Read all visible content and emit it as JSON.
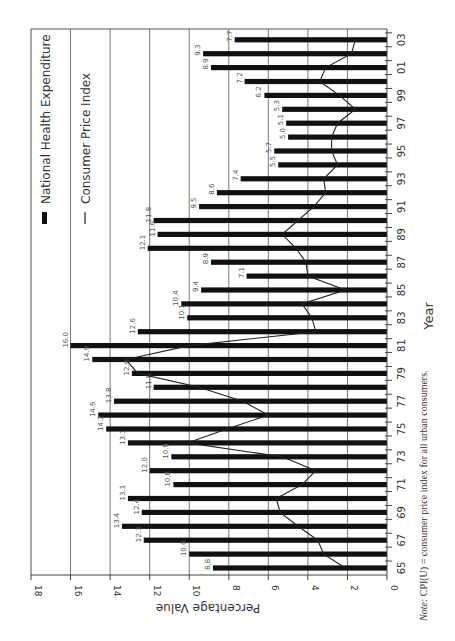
{
  "chart_data": {
    "type": "bar",
    "orientation": "rotated 90 degrees clockwise (years run vertically, values horizontally)",
    "title": "",
    "xlabel": "Year",
    "ylabel": "Percentage Value",
    "ylim": [
      0,
      18
    ],
    "yticks": [
      0,
      2,
      4,
      6,
      8,
      10,
      12,
      14,
      16,
      18
    ],
    "xtick_labels": [
      "65",
      "67",
      "69",
      "71",
      "73",
      "75",
      "77",
      "79",
      "81",
      "83",
      "85",
      "87",
      "89",
      "91",
      "93",
      "95",
      "97",
      "99",
      "01",
      "03"
    ],
    "grid": true,
    "legend_position": "upper left (rotated)",
    "legend": [
      "National Health Expenditure",
      "Consumer Price Index"
    ],
    "categories": [
      "65",
      "66",
      "67",
      "68",
      "69",
      "70",
      "71",
      "72",
      "73",
      "74",
      "75",
      "76",
      "77",
      "78",
      "79",
      "80",
      "81",
      "82",
      "83",
      "84",
      "85",
      "86",
      "87",
      "88",
      "89",
      "90",
      "91",
      "92",
      "93",
      "94",
      "95",
      "96",
      "97",
      "98",
      "99",
      "00",
      "01",
      "02",
      "03"
    ],
    "series": [
      {
        "name": "National Health Expenditure",
        "type": "bar",
        "values": [
          8.8,
          10.0,
          12.3,
          13.4,
          12.4,
          13.1,
          10.8,
          12.0,
          10.9,
          13.1,
          14.2,
          14.6,
          13.8,
          11.8,
          12.9,
          14.9,
          16.0,
          12.6,
          10.1,
          10.4,
          9.4,
          7.1,
          8.9,
          12.1,
          11.6,
          11.8,
          9.5,
          8.6,
          7.4,
          5.5,
          5.7,
          5.0,
          5.1,
          5.3,
          6.2,
          7.2,
          8.9,
          9.3,
          7.7
        ],
        "labels": [
          "8.8",
          "10.0",
          "12.3",
          "13.4",
          "12.4",
          "13.1",
          "10.8",
          "12.0",
          "10.9",
          "13.1",
          "14.2",
          "14.6",
          "13.8",
          "11.8",
          "12.9",
          "14.9",
          "16.0",
          "12.6",
          "10.1",
          "10.4",
          "9.4",
          "7.1",
          "8.9",
          "12.1",
          "11.6",
          "11.8",
          "9.5",
          "8.6",
          "7.4",
          "5.5",
          "5.7",
          "5.0",
          "5.1",
          "5.3",
          "6.2",
          "7.2",
          "8.9",
          "9.3",
          "7.7"
        ]
      },
      {
        "name": "Consumer Price Index",
        "type": "line",
        "values": [
          2.1,
          3.2,
          3.5,
          4.5,
          5.4,
          5.6,
          4.3,
          3.6,
          5.3,
          10.1,
          8.1,
          6.0,
          7.3,
          9.5,
          12.6,
          13.2,
          10.0,
          3.6,
          3.8,
          4.3,
          2.1,
          4.0,
          4.1,
          4.6,
          5.3,
          4.5,
          3.7,
          3.1,
          3.2,
          2.5,
          2.8,
          2.8,
          2.5,
          1.6,
          2.4,
          3.4,
          3.1,
          1.8,
          1.6
        ]
      }
    ],
    "note": "CPI(U) = consumer price index for all urban consumers."
  },
  "labels": {
    "legend_bar": "National Health Expenditure",
    "legend_line": "Consumer Price Index",
    "x_axis_title": "Year",
    "y_axis_title": "Percentage Value",
    "note_prefix": "Note:",
    "note_text": " CPI(U) = consumer price index for all urban consumers."
  },
  "colors": {
    "bar": "#111111",
    "line": "#222222",
    "grid": "#777777",
    "text": "#333333"
  }
}
